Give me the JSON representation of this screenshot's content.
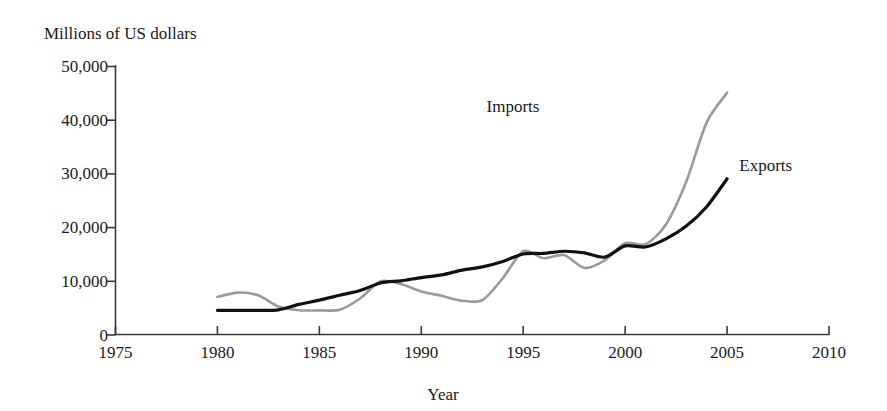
{
  "chart_data": {
    "type": "line",
    "title": "",
    "ylabel": "Millions of US dollars",
    "xlabel": "Year",
    "xlim": [
      1975,
      2010
    ],
    "ylim": [
      0,
      50000
    ],
    "xticks": [
      1975,
      1980,
      1985,
      1990,
      1995,
      2000,
      2005,
      2010
    ],
    "xtick_labels": [
      "1975",
      "1980",
      "1985",
      "1990",
      "1995",
      "2000",
      "2005",
      "2010"
    ],
    "yticks": [
      0,
      10000,
      20000,
      30000,
      40000,
      50000
    ],
    "ytick_labels": [
      "0",
      "10,000",
      "20,000",
      "30,000",
      "40,000",
      "50,000"
    ],
    "grid": false,
    "legend_position": "inline-annotations",
    "x": [
      1980,
      1981,
      1982,
      1983,
      1984,
      1985,
      1986,
      1987,
      1988,
      1989,
      1990,
      1991,
      1992,
      1993,
      1994,
      1995,
      1996,
      1997,
      1998,
      1999,
      2000,
      2001,
      2002,
      2003,
      2004,
      2005
    ],
    "series": [
      {
        "name": "Imports",
        "color": "#9a9a9a",
        "stroke_width": 2.6,
        "label_x": 1994.5,
        "label_y": 41500,
        "values": [
          7000,
          7800,
          7300,
          5200,
          4500,
          4500,
          4600,
          6700,
          9900,
          9400,
          8000,
          7200,
          6300,
          6400,
          10500,
          15500,
          14200,
          14800,
          12400,
          13800,
          17000,
          16800,
          20500,
          28500,
          39500,
          45000
        ]
      },
      {
        "name": "Exports",
        "color": "#111111",
        "stroke_width": 3.2,
        "label_x": 2005.6,
        "label_y": 30500,
        "values": [
          4500,
          4500,
          4500,
          4600,
          5600,
          6400,
          7300,
          8200,
          9600,
          10000,
          10600,
          11100,
          12000,
          12600,
          13600,
          15000,
          15100,
          15500,
          15200,
          14400,
          16500,
          16300,
          17800,
          20200,
          23800,
          29000
        ]
      }
    ],
    "annotations": [
      {
        "text": "Imports",
        "series": "Imports"
      },
      {
        "text": "Exports",
        "series": "Exports"
      }
    ]
  }
}
